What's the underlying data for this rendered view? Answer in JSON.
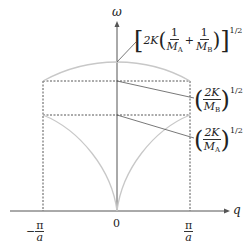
{
  "diagram": {
    "type": "phonon-dispersion-diatomic-chain",
    "axes": {
      "vertical_label": "ω",
      "horizontal_label": "q"
    },
    "ticks": {
      "left": {
        "sign": "−",
        "num": "π",
        "den": "a"
      },
      "origin": "0",
      "right": {
        "num": "π",
        "den": "a"
      }
    },
    "annotations": {
      "top": {
        "prefix": "2K",
        "one": "1",
        "MA": "M",
        "MA_sub": "A",
        "plus": "+",
        "MB": "M",
        "MB_sub": "B",
        "exp": "1/2"
      },
      "middle": {
        "num": "2K",
        "den": "M",
        "den_sub": "B",
        "exp": "1/2"
      },
      "bottom": {
        "num": "2K",
        "den": "M",
        "den_sub": "A",
        "exp": "1/2"
      }
    },
    "colors": {
      "axis": "#555555",
      "curve": "#c8c8c8",
      "dashed": "#444444",
      "leader": "#555555"
    }
  }
}
